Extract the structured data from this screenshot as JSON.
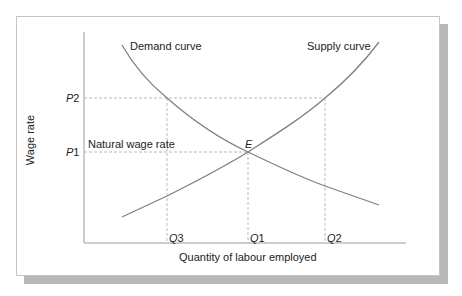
{
  "figure": {
    "x_axis_label": "Quantity of labour employed",
    "y_axis_label": "Wage rate",
    "demand_label": "Demand curve",
    "supply_label": "Supply curve",
    "equilibrium_label": "E",
    "natural_wage_label": "Natural wage rate",
    "y_ticks": [
      {
        "letter": "P",
        "num": "2"
      },
      {
        "letter": "P",
        "num": "1"
      }
    ],
    "x_ticks": [
      {
        "letter": "Q",
        "num": "3"
      },
      {
        "letter": "Q",
        "num": "1"
      },
      {
        "letter": "Q",
        "num": "2"
      }
    ],
    "colors": {
      "curve": "#808080",
      "axis": "#9a9a9a",
      "guide": "#a8a8a8",
      "shadow": "#b8b8b8"
    }
  }
}
